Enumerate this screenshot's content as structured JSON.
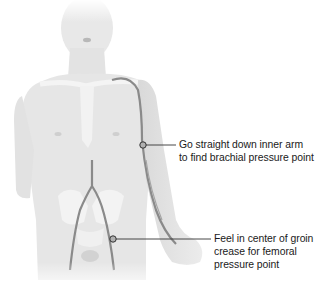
{
  "figure": {
    "background_color": "#ffffff",
    "body_fill": "#e6e6e6",
    "artery_color": "#8a8a8a",
    "leader_color": "#333333"
  },
  "callouts": [
    {
      "id": "brachial",
      "marker": {
        "x": 143,
        "y": 145
      },
      "lines": [
        "Go straight down inner arm",
        "to find brachial pressure point"
      ]
    },
    {
      "id": "femoral",
      "marker": {
        "x": 113,
        "y": 239
      },
      "lines": [
        "Feel in center of groin",
        "crease for femoral",
        "pressure point"
      ]
    }
  ]
}
